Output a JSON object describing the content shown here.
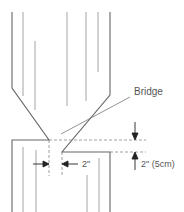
{
  "diagram": {
    "labels": {
      "bridge": "Bridge",
      "gap_horizontal": "2\"",
      "gap_vertical": "2\" (5cm)"
    },
    "colors": {
      "outline": "#666666",
      "grain": "#999999",
      "dashed": "#888888",
      "arrow": "#222222",
      "text": "#555555"
    }
  }
}
